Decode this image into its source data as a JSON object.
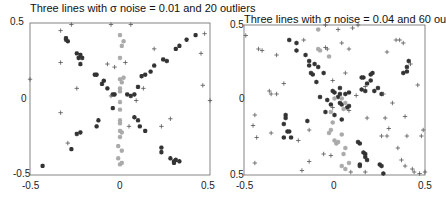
{
  "chart_data": [
    {
      "type": "scatter",
      "title": "Three lines with σ noise = 0.01 and 20 outliers",
      "xlabel": "",
      "ylabel": "",
      "xlim": [
        -0.5,
        0.5
      ],
      "ylim": [
        -0.5,
        0.5
      ],
      "xticks": [
        "-0.5",
        "0",
        "0.5"
      ],
      "yticks": [
        "0.5",
        "0",
        "-0.5"
      ],
      "grid": false,
      "series": [
        {
          "name": "line-1 (dark)",
          "marker": "*",
          "color": "#333333",
          "points": [
            [
              -0.3,
              0.4
            ],
            [
              -0.3,
              0.39
            ],
            [
              -0.29,
              0.38
            ],
            [
              -0.24,
              0.3
            ],
            [
              -0.22,
              0.29
            ],
            [
              -0.21,
              0.27
            ],
            [
              -0.23,
              0.27
            ],
            [
              -0.22,
              0.23
            ],
            [
              -0.14,
              0.16
            ],
            [
              -0.13,
              0.16
            ],
            [
              -0.09,
              0.12
            ],
            [
              -0.1,
              0.1
            ],
            [
              -0.07,
              0.07
            ],
            [
              -0.04,
              0.03
            ],
            [
              -0.03,
              0.03
            ],
            [
              -0.04,
              -0.06
            ],
            [
              -0.22,
              -0.22
            ],
            [
              -0.24,
              -0.23
            ],
            [
              -0.12,
              -0.14
            ],
            [
              -0.13,
              -0.18
            ],
            [
              -0.27,
              -0.33
            ],
            [
              -0.43,
              -0.44
            ]
          ]
        },
        {
          "name": "line-2 (dark)",
          "marker": "*",
          "color": "#333333",
          "points": [
            [
              0.04,
              0.03
            ],
            [
              0.06,
              0.02
            ],
            [
              0.08,
              0.03
            ],
            [
              0.1,
              0.08
            ],
            [
              0.12,
              0.15
            ],
            [
              0.14,
              0.16
            ],
            [
              0.17,
              0.18
            ],
            [
              0.19,
              0.22
            ],
            [
              0.24,
              0.26
            ],
            [
              0.26,
              0.25
            ],
            [
              0.31,
              0.33
            ],
            [
              0.33,
              0.35
            ],
            [
              0.37,
              0.39
            ],
            [
              0.42,
              0.42
            ],
            [
              0.08,
              -0.12
            ],
            [
              0.1,
              -0.14
            ],
            [
              0.11,
              -0.18
            ],
            [
              0.14,
              -0.21
            ],
            [
              0.23,
              -0.32
            ],
            [
              0.23,
              -0.35
            ],
            [
              0.28,
              -0.39
            ],
            [
              0.3,
              -0.41
            ],
            [
              0.31,
              -0.4
            ],
            [
              0.33,
              -0.41
            ],
            [
              0.3,
              -0.42
            ]
          ]
        },
        {
          "name": "line-3 (light)",
          "marker": "*",
          "color": "#aaaaaa",
          "points": [
            [
              0.0,
              0.42
            ],
            [
              0.02,
              0.38
            ],
            [
              0.01,
              0.35
            ],
            [
              0.0,
              0.27
            ],
            [
              0.02,
              0.14
            ],
            [
              0.0,
              0.13
            ],
            [
              0.01,
              0.11
            ],
            [
              0.0,
              0.07
            ],
            [
              0.0,
              0.05
            ],
            [
              0.0,
              -0.02
            ],
            [
              0.0,
              -0.07
            ],
            [
              0.0,
              -0.14
            ],
            [
              0.0,
              -0.16
            ],
            [
              0.0,
              -0.21
            ],
            [
              0.01,
              -0.22
            ],
            [
              0.0,
              -0.25
            ],
            [
              -0.01,
              -0.31
            ],
            [
              0.01,
              -0.34
            ],
            [
              -0.01,
              -0.39
            ],
            [
              0.0,
              -0.43
            ],
            [
              0.01,
              -0.42
            ]
          ]
        },
        {
          "name": "outliers",
          "marker": "+",
          "color": "#555555",
          "points": [
            [
              -0.5,
              0.13
            ],
            [
              -0.33,
              0.45
            ],
            [
              -0.27,
              0.49
            ],
            [
              -0.05,
              0.49
            ],
            [
              0.06,
              0.49
            ],
            [
              -0.33,
              0.24
            ],
            [
              -0.24,
              0.07
            ],
            [
              -0.07,
              0.23
            ],
            [
              -0.03,
              0.21
            ],
            [
              0.03,
              0.24
            ],
            [
              -0.05,
              0.02
            ],
            [
              0.09,
              -0.01
            ],
            [
              0.13,
              0.07
            ],
            [
              0.19,
              0.33
            ],
            [
              0.45,
              0.3
            ],
            [
              0.46,
              0.09
            ],
            [
              0.47,
              0.43
            ],
            [
              0.5,
              -0.01
            ],
            [
              -0.33,
              -0.09
            ],
            [
              0.05,
              -0.18
            ],
            [
              0.23,
              -0.18
            ],
            [
              0.28,
              -0.13
            ],
            [
              -0.29,
              -0.29
            ]
          ]
        }
      ]
    },
    {
      "type": "scatter",
      "title": "Three lines with σ noise = 0.04 and 60 outliers",
      "xlabel": "",
      "ylabel": "",
      "xlim": [
        -0.5,
        0.5
      ],
      "ylim": [
        -0.5,
        0.5
      ],
      "xticks": [
        "-0.5",
        "0",
        "0.5"
      ],
      "yticks": [
        "0.5",
        "0",
        "-0.5"
      ],
      "grid": false,
      "series": [
        {
          "name": "line-1 (dark)",
          "marker": "*",
          "color": "#333333",
          "points": [
            [
              -0.25,
              0.4
            ],
            [
              -0.21,
              0.38
            ],
            [
              -0.21,
              0.33
            ],
            [
              -0.16,
              0.3
            ],
            [
              -0.14,
              0.26
            ],
            [
              -0.14,
              0.23
            ],
            [
              -0.11,
              0.24
            ],
            [
              -0.09,
              0.22
            ],
            [
              -0.13,
              0.18
            ],
            [
              -0.12,
              0.17
            ],
            [
              -0.06,
              0.18
            ],
            [
              -0.1,
              0.12
            ],
            [
              -0.08,
              0.02
            ],
            [
              -0.01,
              0.06
            ],
            [
              0.0,
              0.05
            ],
            [
              0.03,
              0.08
            ],
            [
              0.03,
              0.04
            ],
            [
              -0.04,
              0.0
            ],
            [
              -0.02,
              -0.03
            ],
            [
              -0.05,
              -0.08
            ],
            [
              0.0,
              -0.1
            ],
            [
              0.04,
              -0.13
            ],
            [
              -0.15,
              -0.14
            ],
            [
              -0.27,
              -0.1
            ],
            [
              -0.27,
              -0.12
            ],
            [
              -0.28,
              -0.16
            ],
            [
              -0.25,
              -0.21
            ],
            [
              -0.26,
              -0.21
            ],
            [
              -0.24,
              -0.25
            ],
            [
              -0.28,
              -0.25
            ]
          ]
        },
        {
          "name": "line-2 (dark)",
          "marker": "*",
          "color": "#333333",
          "points": [
            [
              0.15,
              0.15
            ],
            [
              0.16,
              0.15
            ],
            [
              0.18,
              0.11
            ],
            [
              0.2,
              0.13
            ],
            [
              0.2,
              0.17
            ],
            [
              0.21,
              0.18
            ],
            [
              0.24,
              0.08
            ],
            [
              0.22,
              0.06
            ],
            [
              0.15,
              0.07
            ],
            [
              0.17,
              0.06
            ],
            [
              0.26,
              0.04
            ],
            [
              0.08,
              0.05
            ],
            [
              0.06,
              0.04
            ],
            [
              0.02,
              0.02
            ],
            [
              0.03,
              -0.02
            ],
            [
              0.04,
              -0.03
            ],
            [
              0.07,
              -0.05
            ],
            [
              0.08,
              -0.04
            ],
            [
              0.13,
              -0.28
            ],
            [
              0.14,
              -0.29
            ],
            [
              0.16,
              -0.35
            ],
            [
              0.17,
              -0.38
            ],
            [
              0.18,
              -0.4
            ],
            [
              0.14,
              -0.43
            ],
            [
              0.14,
              -0.44
            ],
            [
              0.17,
              -0.36
            ],
            [
              0.25,
              -0.43
            ],
            [
              0.26,
              -0.44
            ],
            [
              0.27,
              -0.49
            ],
            [
              0.38,
              0.18
            ],
            [
              0.4,
              0.19
            ],
            [
              0.4,
              0.22
            ],
            [
              0.41,
              0.26
            ]
          ]
        },
        {
          "name": "line-3 (light)",
          "marker": "*",
          "color": "#aaaaaa",
          "points": [
            [
              -0.09,
              0.47
            ],
            [
              -0.08,
              0.33
            ],
            [
              -0.09,
              0.34
            ],
            [
              -0.03,
              0.29
            ],
            [
              0.0,
              0.01
            ],
            [
              0.04,
              0.01
            ],
            [
              0.06,
              -0.02
            ],
            [
              0.05,
              -0.06
            ],
            [
              -0.02,
              -0.08
            ],
            [
              -0.01,
              -0.15
            ],
            [
              -0.02,
              -0.2
            ],
            [
              -0.03,
              -0.22
            ],
            [
              0.0,
              -0.27
            ],
            [
              0.01,
              -0.29
            ],
            [
              0.02,
              -0.28
            ],
            [
              0.04,
              -0.23
            ],
            [
              0.06,
              -0.32
            ],
            [
              0.05,
              -0.36
            ],
            [
              0.04,
              -0.44
            ],
            [
              0.06,
              -0.46
            ],
            [
              0.08,
              -0.42
            ]
          ]
        },
        {
          "name": "outliers",
          "marker": "+",
          "color": "#555555",
          "points": [
            [
              -0.49,
              0.43
            ],
            [
              -0.42,
              0.34
            ],
            [
              -0.4,
              0.33
            ],
            [
              -0.32,
              0.3
            ],
            [
              -0.28,
              0.11
            ],
            [
              -0.36,
              0.06
            ],
            [
              -0.32,
              0.04
            ],
            [
              -0.35,
              0.04
            ],
            [
              -0.17,
              0.4
            ],
            [
              -0.05,
              0.5
            ],
            [
              0.02,
              0.47
            ],
            [
              0.08,
              0.34
            ],
            [
              0.1,
              0.48
            ],
            [
              0.13,
              0.5
            ],
            [
              0.04,
              0.38
            ],
            [
              -0.04,
              0.34
            ],
            [
              -0.05,
              0.35
            ],
            [
              0.06,
              0.18
            ],
            [
              -0.01,
              0.13
            ],
            [
              0.12,
              0.03
            ],
            [
              0.17,
              0.09
            ],
            [
              0.29,
              0.32
            ],
            [
              0.34,
              0.4
            ],
            [
              0.36,
              0.4
            ],
            [
              0.38,
              0.38
            ],
            [
              0.42,
              0.24
            ],
            [
              0.46,
              0.1
            ],
            [
              0.27,
              0.04
            ],
            [
              -0.44,
              -0.1
            ],
            [
              -0.45,
              -0.17
            ],
            [
              -0.43,
              -0.25
            ],
            [
              -0.35,
              -0.22
            ],
            [
              -0.2,
              -0.27
            ],
            [
              -0.14,
              -0.2
            ],
            [
              -0.01,
              -0.05
            ],
            [
              0.08,
              -0.07
            ],
            [
              0.18,
              -0.12
            ],
            [
              0.28,
              -0.12
            ],
            [
              0.3,
              -0.19
            ],
            [
              0.32,
              -0.02
            ],
            [
              0.39,
              -0.11
            ],
            [
              0.26,
              -0.24
            ],
            [
              0.29,
              -0.24
            ],
            [
              0.4,
              -0.24
            ],
            [
              0.49,
              -0.2
            ],
            [
              0.48,
              -0.24
            ],
            [
              0.35,
              -0.32
            ],
            [
              0.37,
              -0.4
            ],
            [
              0.39,
              -0.44
            ],
            [
              0.43,
              -0.46
            ],
            [
              0.44,
              -0.48
            ],
            [
              0.5,
              -0.48
            ],
            [
              0.47,
              -0.49
            ],
            [
              -0.44,
              -0.42
            ],
            [
              -0.18,
              -0.47
            ],
            [
              -0.14,
              -0.41
            ],
            [
              -0.06,
              -0.36
            ],
            [
              -0.02,
              -0.37
            ],
            [
              0.09,
              -0.48
            ],
            [
              0.17,
              -0.48
            ]
          ]
        }
      ]
    }
  ],
  "panels": [
    {
      "title": "Three lines with σ noise = 0.01 and 20 outliers",
      "y_top": "0.5",
      "y_mid": "0",
      "y_bot": "-0.5",
      "x_left": "-0.5",
      "x_mid": "0",
      "x_right": "0.5"
    },
    {
      "title": "Three lines with σ noise = 0.04 and 60 outliers",
      "y_top": "0.5",
      "y_mid": "0",
      "y_bot": "0.5",
      "x_left": "-0.5",
      "x_mid": "0",
      "x_right": "0.5"
    }
  ]
}
